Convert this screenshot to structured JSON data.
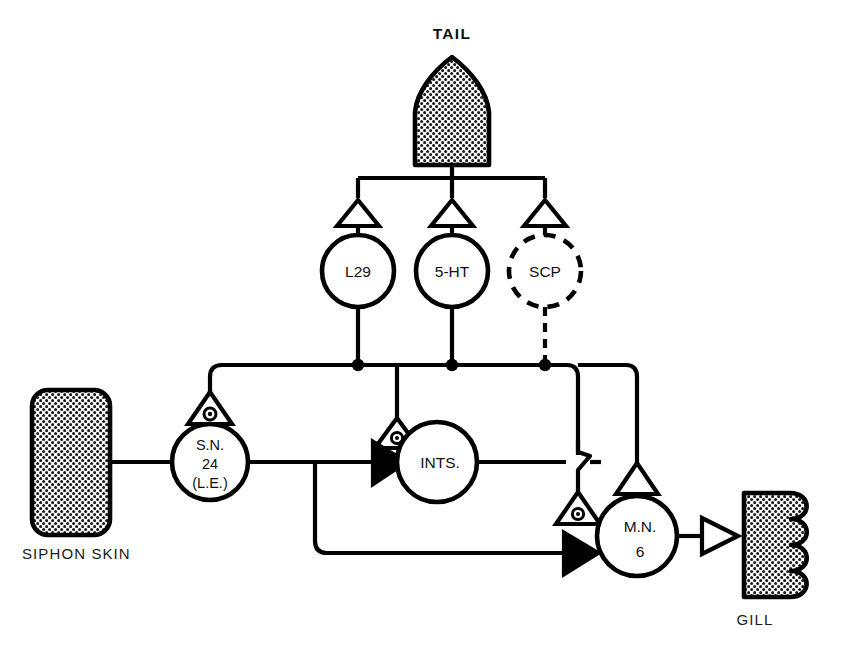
{
  "diagram": {
    "title_visible": false,
    "background_color": "#ffffff",
    "line_color": "#000000"
  },
  "organs": [
    {
      "id": "tail",
      "label": "TAIL",
      "label_position": "above",
      "shape": "pointed-arch",
      "fill": "stipple"
    },
    {
      "id": "siphon-skin",
      "label": "SIPHON SKIN",
      "label_position": "below",
      "shape": "rounded-rectangle",
      "fill": "stipple"
    },
    {
      "id": "gill",
      "label": "GILL",
      "label_position": "below",
      "shape": "scalloped-rectangle",
      "fill": "stipple"
    }
  ],
  "neurons": [
    {
      "id": "l29",
      "lines": [
        "L29"
      ],
      "style": "solid"
    },
    {
      "id": "5ht",
      "lines": [
        "5-HT"
      ],
      "style": "solid"
    },
    {
      "id": "scp",
      "lines": [
        "SCP"
      ],
      "style": "dashed"
    },
    {
      "id": "sn24",
      "lines": [
        "S.N.",
        "24",
        "(L.E.)"
      ],
      "style": "solid"
    },
    {
      "id": "ints",
      "lines": [
        "INTS."
      ],
      "style": "solid"
    },
    {
      "id": "mn6",
      "lines": [
        "M.N.",
        "6"
      ],
      "style": "solid"
    }
  ],
  "synapses": [
    {
      "id": "tail-to-l29",
      "type": "open-triangle",
      "meaning": "excitatory"
    },
    {
      "id": "tail-to-5ht",
      "type": "open-triangle",
      "meaning": "excitatory"
    },
    {
      "id": "tail-to-scp",
      "type": "open-triangle",
      "meaning": "excitatory"
    },
    {
      "id": "mod-onto-sn24",
      "type": "triangle-with-dot",
      "meaning": "modulatory"
    },
    {
      "id": "mod-onto-ints",
      "type": "triangle-with-dot",
      "meaning": "modulatory"
    },
    {
      "id": "mod-onto-mn6",
      "type": "triangle-with-dot",
      "meaning": "modulatory"
    },
    {
      "id": "sn24-to-ints",
      "type": "filled-triangle",
      "meaning": "chemical-excitatory"
    },
    {
      "id": "sn24-to-mn6",
      "type": "filled-triangle",
      "meaning": "chemical-excitatory"
    },
    {
      "id": "ints-to-mn6",
      "type": "open-triangle",
      "meaning": "excitatory"
    },
    {
      "id": "mn6-to-gill",
      "type": "open-triangle",
      "meaning": "neuromuscular"
    }
  ],
  "connections": [
    {
      "from": "tail",
      "to": "l29",
      "style": "solid"
    },
    {
      "from": "tail",
      "to": "5ht",
      "style": "solid"
    },
    {
      "from": "tail",
      "to": "scp",
      "style": "dashed"
    },
    {
      "from": "l29",
      "to": "bus",
      "style": "solid"
    },
    {
      "from": "5ht",
      "to": "bus",
      "style": "solid"
    },
    {
      "from": "scp",
      "to": "bus",
      "style": "dashed"
    },
    {
      "from": "bus",
      "to": "sn24",
      "style": "solid"
    },
    {
      "from": "bus",
      "to": "ints",
      "style": "solid"
    },
    {
      "from": "bus",
      "to": "mn6",
      "style": "solid"
    },
    {
      "from": "siphon-skin",
      "to": "sn24",
      "style": "solid"
    },
    {
      "from": "sn24",
      "to": "ints",
      "style": "solid"
    },
    {
      "from": "sn24",
      "to": "mn6",
      "style": "solid"
    },
    {
      "from": "ints",
      "to": "mn6",
      "style": "solid"
    },
    {
      "from": "mn6",
      "to": "gill",
      "style": "solid"
    }
  ],
  "labels": {
    "tail": "TAIL",
    "siphon_skin": "SIPHON SKIN",
    "gill": "GILL",
    "l29": "L29",
    "ht5": "5-HT",
    "scp": "SCP",
    "sn24_line1": "S.N.",
    "sn24_line2": "24",
    "sn24_line3": "(L.E.)",
    "ints": "INTS.",
    "mn6_line1": "M.N.",
    "mn6_line2": "6"
  }
}
